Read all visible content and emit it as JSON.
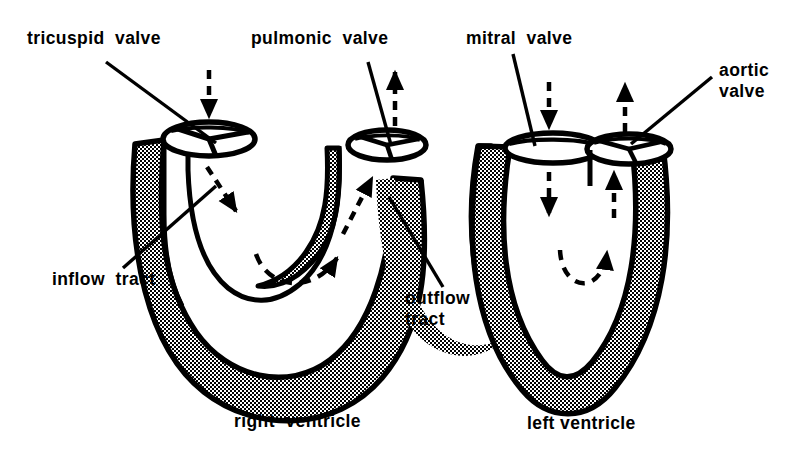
{
  "figure": {
    "background_color": "#ffffff",
    "ink_color": "#000000",
    "wall_fill": "stippled-halftone"
  },
  "labels": {
    "tricuspid_valve": "tricuspid  valve",
    "pulmonic_valve": "pulmonic  valve",
    "mitral_valve": "mitral  valve",
    "aortic_valve": "aortic\nvalve",
    "inflow_tract": "inflow  tract",
    "outflow_tract": "outflow\ntract"
  },
  "captions": {
    "right_ventricle": "right  ventricle",
    "left_ventricle": "left ventricle"
  },
  "flow_arrows": {
    "rv_inflow_external": "down-arrow-into-tricuspid",
    "rv_outflow_external": "up-arrow-out-of-pulmonic",
    "rv_inflow_internal": "dashed-arrow-down-right",
    "rv_outflow_internal": "dashed-arrow-up-right",
    "rv_apical_loop": "dashed-curved-arrow-rightward",
    "lv_inflow_external": "down-arrow-into-mitral",
    "lv_outflow_external": "up-arrow-out-of-aortic",
    "lv_inflow_internal": "dashed-arrow-down",
    "lv_outflow_internal": "dashed-arrow-up",
    "lv_apical_loop": "dashed-curved-arrow-upward"
  },
  "structures": {
    "right_ventricle": "U-shaped crescent chamber with tricuspid inlet and pulmonic outlet",
    "left_ventricle": "V-shaped thick-walled chamber with mitral inlet and aortic outlet"
  }
}
